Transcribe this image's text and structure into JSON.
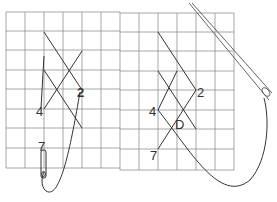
{
  "diagram": {
    "left_panel": {
      "labels": [
        {
          "text": "2",
          "x": 78,
          "y": 96
        },
        {
          "text": "4",
          "x": 37,
          "y": 116
        },
        {
          "text": "7",
          "x": 37,
          "y": 152
        }
      ]
    },
    "right_panel": {
      "labels": [
        {
          "text": "2",
          "x": 197,
          "y": 97
        },
        {
          "text": "4",
          "x": 149,
          "y": 115
        },
        {
          "text": "D",
          "x": 174,
          "y": 129
        },
        {
          "text": "7",
          "x": 149,
          "y": 159
        }
      ]
    },
    "colors": {
      "grid": "#8a8a8a",
      "stroke": "#333333",
      "background": "#ffffff"
    }
  }
}
